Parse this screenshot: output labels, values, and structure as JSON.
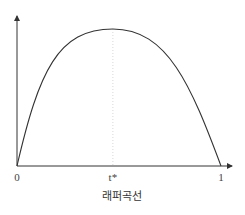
{
  "chart_data": {
    "type": "line",
    "title": "",
    "caption": "래퍼곡선",
    "xlabel": "",
    "ylabel": "",
    "xlim": [
      0,
      1
    ],
    "x_ticks": [
      {
        "value": 0,
        "label": "0"
      },
      {
        "value": 0.47,
        "label": "t*"
      },
      {
        "value": 1,
        "label": "1"
      }
    ],
    "series": [
      {
        "name": "Laffer curve",
        "shape": "inverted-parabola",
        "x_start": 0,
        "x_peak": 0.47,
        "x_end": 1,
        "y_start": 0,
        "y_end": 0
      }
    ],
    "peak_marker": {
      "x": 0.47,
      "style": "dotted-vertical"
    },
    "grid": false,
    "legend": "none"
  }
}
